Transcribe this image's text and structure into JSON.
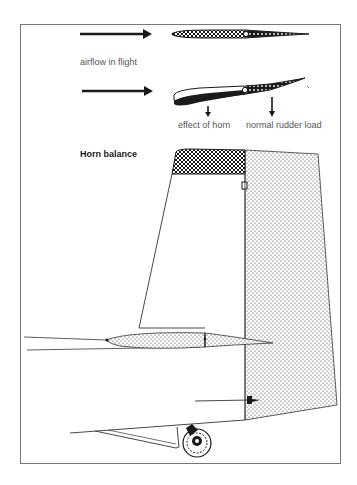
{
  "labels": {
    "airflow": "airflow in flight",
    "effect_of_horn": "effect of horn",
    "normal_rudder_load": "normal rudder load",
    "title": "Horn balance"
  },
  "legend": {
    "horn_pattern": "crosshatch",
    "rudder_pattern": "dotted"
  },
  "colors": {
    "ink": "#1a1a1a",
    "frame": "#777777",
    "text": "#555555",
    "background": "#ffffff"
  }
}
